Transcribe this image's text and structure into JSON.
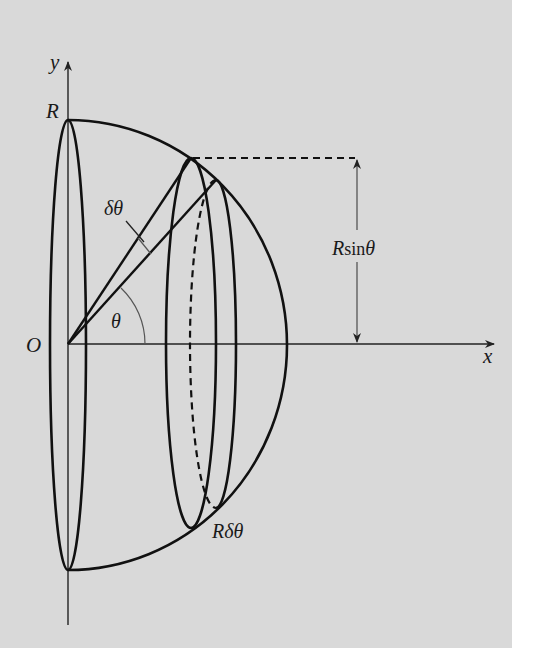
{
  "diagram": {
    "background_color": "#d9d9d9",
    "line_color": "#111111",
    "axes": {
      "x_label": "x",
      "y_label": "y",
      "origin_label": "O"
    },
    "labels": {
      "radius": "R",
      "angle": "θ",
      "delta_angle": "δθ",
      "ring_height": "Rsinθ",
      "ring_height_R": "R",
      "ring_height_sin": "sin",
      "ring_height_theta": "θ",
      "arc_length": "Rδθ"
    }
  }
}
